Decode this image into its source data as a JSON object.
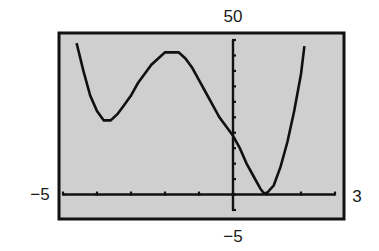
{
  "chart_data": {
    "type": "line",
    "title": "",
    "xlabel": "",
    "ylabel": "",
    "xlim": [
      -5,
      3
    ],
    "ylim": [
      -5,
      50
    ],
    "x_tick_step": 1,
    "y_tick_step": 5,
    "grid": false,
    "window_labels": {
      "xmin": "−5",
      "xmax": "3",
      "ymin": "−5",
      "ymax": "50"
    },
    "colors": {
      "screen_background": "#cfcfcf",
      "frame": "#111111",
      "curve": "#111111",
      "axes": "#111111"
    },
    "series": [
      {
        "name": "f(x)",
        "x": [
          -4.6,
          -4.4,
          -4.2,
          -4.0,
          -3.8,
          -3.6,
          -3.4,
          -3.2,
          -3.0,
          -2.8,
          -2.6,
          -2.4,
          -2.2,
          -2.0,
          -1.8,
          -1.6,
          -1.4,
          -1.2,
          -1.0,
          -0.8,
          -0.6,
          -0.4,
          -0.2,
          0.0,
          0.2,
          0.4,
          0.6,
          0.8,
          0.9,
          1.0,
          1.2,
          1.4,
          1.6,
          1.8,
          2.0,
          2.1
        ],
        "y": [
          49,
          40,
          32,
          27,
          24,
          24,
          26,
          29,
          32,
          36,
          39,
          42,
          44,
          46,
          46,
          46,
          44,
          41,
          37,
          33,
          29,
          25,
          22,
          19,
          15,
          10,
          6,
          2,
          0.5,
          0.5,
          3,
          9,
          17,
          27,
          39,
          48
        ]
      }
    ]
  }
}
